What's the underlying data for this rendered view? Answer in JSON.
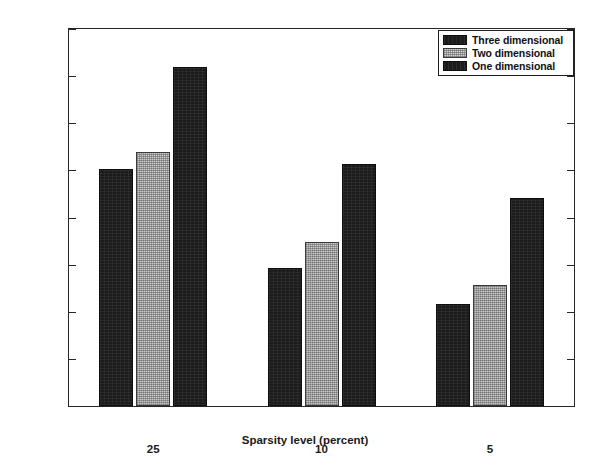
{
  "chart_data": {
    "type": "bar",
    "title": "",
    "xlabel": "Sparsity level (percent)",
    "ylabel": "Time (s)",
    "categories": [
      "25",
      "10",
      "5"
    ],
    "series": [
      {
        "name": "Three dimensional",
        "values": [
          50.3,
          29.2,
          21.7
        ],
        "color": "#1b1b1b",
        "fill": "solid-dark"
      },
      {
        "name": "Two dimensional",
        "values": [
          53.9,
          34.7,
          25.7
        ],
        "color": "#c9c9c9",
        "fill": "light-dotted"
      },
      {
        "name": "One dimensional",
        "values": [
          72.0,
          51.4,
          44.2
        ],
        "color": "#1b1b1b",
        "fill": "solid-dark"
      }
    ],
    "ylim": [
      0,
      80
    ],
    "yticks": [
      0,
      10,
      20,
      30,
      40,
      50,
      60,
      70,
      80
    ],
    "ytick_labels": [
      "0",
      "10",
      "20",
      "30",
      "40",
      "50",
      "60",
      "70",
      "80"
    ],
    "grid": false,
    "legend_position": "top-right",
    "frame": true
  },
  "legend": {
    "entries": [
      {
        "label": "Three dimensional"
      },
      {
        "label": "Two dimensional"
      },
      {
        "label": "One dimensional"
      }
    ]
  }
}
